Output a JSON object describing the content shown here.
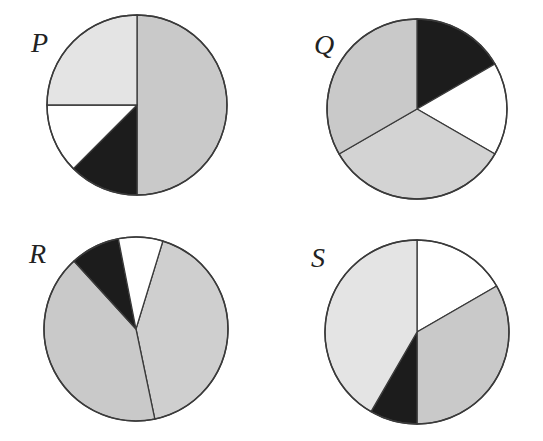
{
  "colors": {
    "medium_gray": "#c9c9c9",
    "light_gray": "#e4e4e4",
    "bottom_gray": "#d3d3d3",
    "white": "#ffffff",
    "black": "#1c1c1c",
    "outline": "#3a3a3a"
  },
  "chart_data": [
    {
      "type": "pie",
      "title": "P",
      "center": [
        137,
        105
      ],
      "radius": 90,
      "start_angle_deg": 0,
      "direction": "clockwise",
      "slices": [
        {
          "label": "medium gray",
          "fraction": 0.5,
          "color": "#c9c9c9"
        },
        {
          "label": "black",
          "fraction": 0.125,
          "color": "#1c1c1c"
        },
        {
          "label": "white",
          "fraction": 0.125,
          "color": "#ffffff"
        },
        {
          "label": "light gray",
          "fraction": 0.25,
          "color": "#e4e4e4"
        }
      ]
    },
    {
      "type": "pie",
      "title": "Q",
      "center": [
        417,
        109
      ],
      "radius": 90,
      "start_angle_deg": 0,
      "direction": "clockwise",
      "slices": [
        {
          "label": "black",
          "fraction": 0.1667,
          "color": "#1c1c1c"
        },
        {
          "label": "white",
          "fraction": 0.1667,
          "color": "#ffffff"
        },
        {
          "label": "light gray",
          "fraction": 0.3333,
          "color": "#d3d3d3"
        },
        {
          "label": "medium gray",
          "fraction": 0.3333,
          "color": "#c9c9c9"
        }
      ]
    },
    {
      "type": "pie",
      "title": "R",
      "center": [
        136,
        329
      ],
      "radius": 92,
      "start_angle_deg": 17,
      "direction": "clockwise",
      "slices": [
        {
          "label": "medium gray (right)",
          "fraction": 0.42,
          "color": "#cfcfcf"
        },
        {
          "label": "medium gray (left)",
          "fraction": 0.415,
          "color": "#c9c9c9"
        },
        {
          "label": "black",
          "fraction": 0.087,
          "color": "#1c1c1c"
        },
        {
          "label": "white",
          "fraction": 0.078,
          "color": "#ffffff"
        }
      ]
    },
    {
      "type": "pie",
      "title": "S",
      "center": [
        417,
        332
      ],
      "radius": 92,
      "start_angle_deg": 0,
      "direction": "clockwise",
      "slices": [
        {
          "label": "white",
          "fraction": 0.1667,
          "color": "#ffffff"
        },
        {
          "label": "medium gray",
          "fraction": 0.3333,
          "color": "#c9c9c9"
        },
        {
          "label": "black",
          "fraction": 0.0833,
          "color": "#1c1c1c"
        },
        {
          "label": "light gray",
          "fraction": 0.4167,
          "color": "#e4e4e4"
        }
      ]
    }
  ],
  "labels": [
    {
      "text": "P",
      "x": 31,
      "y": 29
    },
    {
      "text": "Q",
      "x": 314,
      "y": 31
    },
    {
      "text": "R",
      "x": 29,
      "y": 240
    },
    {
      "text": "S",
      "x": 311,
      "y": 244
    }
  ]
}
